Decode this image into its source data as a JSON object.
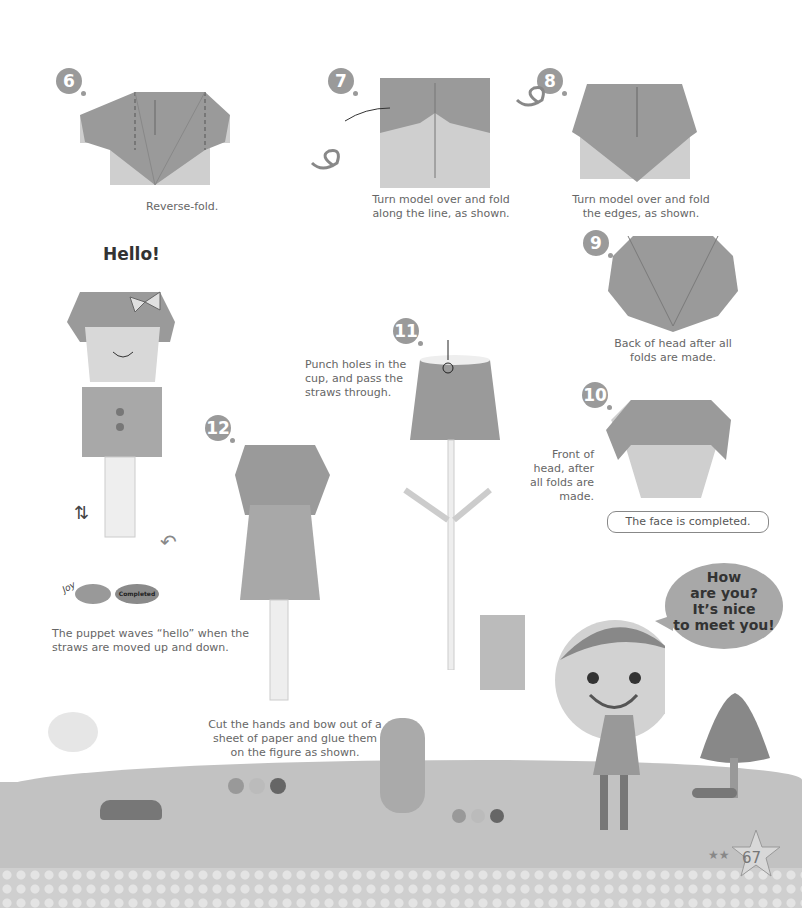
{
  "page": {
    "number": "67",
    "heading": "Hello!"
  },
  "steps": [
    {
      "number": "6",
      "caption": "Reverse-fold."
    },
    {
      "number": "7",
      "caption": "Turn model over and fold along the line, as shown."
    },
    {
      "number": "8",
      "caption": "Turn model over and fold the edges, as shown."
    },
    {
      "number": "9",
      "caption": "Back of head after all folds are made."
    },
    {
      "number": "10",
      "caption": "Front of head, after all folds are made."
    },
    {
      "number": "11",
      "caption": "Punch holes in the cup, and pass the straws through."
    },
    {
      "number": "12",
      "caption": "Cut the hands and bow out of a sheet of paper and glue them on the figure as shown."
    }
  ],
  "face_completed": "The face is completed.",
  "puppet_caption": "The puppet waves “hello” when the straws are moved up and down.",
  "badges": {
    "joy": "Joy",
    "completed": "Completed"
  },
  "speech_bubble": {
    "lines": [
      "How",
      "are you?",
      "It’s nice",
      "to meet you!"
    ]
  },
  "colors": {
    "paper_dark": "#9a9a9a",
    "paper_light": "#cfcfcf",
    "ground": "#c2c2c2",
    "text": "#666666"
  }
}
